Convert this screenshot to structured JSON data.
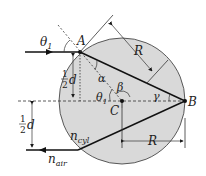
{
  "diagram": {
    "labels": {
      "theta1_top": "θ",
      "theta1_top_sub": "1",
      "A": "A",
      "R_top": "R",
      "alpha": "α",
      "beta": "β",
      "gamma": "γ",
      "theta1_mid": "θ",
      "theta1_mid_sub": "1",
      "C": "C",
      "B": "B",
      "half_d_top_num": "1",
      "half_d_top_den": "2",
      "half_d_top_d": "d",
      "half_d_bot_num": "1",
      "half_d_bot_den": "2",
      "half_d_bot_d": "d",
      "n_cyl": "n",
      "n_cyl_sub": "cyl",
      "n_air": "n",
      "n_air_sub": "air",
      "R_bottom": "R"
    },
    "colors": {
      "cylinder_fill": "#d9d9d9",
      "line": "#1a1a1a"
    }
  }
}
